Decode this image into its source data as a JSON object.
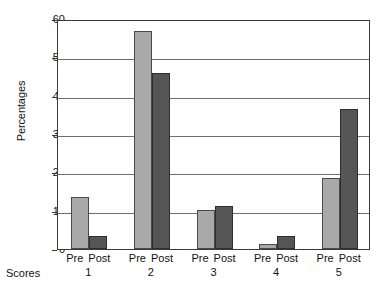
{
  "chart_data": {
    "type": "bar",
    "title": "",
    "subtitle": "",
    "xlabel": "Scores",
    "ylabel": "Percentages",
    "categories": [
      "1",
      "2",
      "3",
      "4",
      "5"
    ],
    "series": [
      {
        "name": "Pre",
        "values": [
          13.5,
          57.0,
          10.3,
          1.2,
          18.6
        ]
      },
      {
        "name": "Post",
        "values": [
          3.3,
          46.0,
          11.2,
          3.3,
          36.4
        ]
      }
    ],
    "ylim": [
      0,
      60
    ],
    "xlim": null,
    "yticks": [
      0,
      10,
      20,
      30,
      40,
      50,
      60
    ],
    "ytick_labels": [
      "0",
      "10",
      "20",
      "30",
      "40",
      "50",
      "60"
    ],
    "grid": true,
    "grid_axis": "y",
    "legend": false,
    "legend_position": "none",
    "colors": {
      "pre": "#a9a9a9",
      "post": "#555555",
      "axis": "#3a3a3a",
      "grid": "#6f6f6f",
      "text": "#111111",
      "background": "#ffffff"
    },
    "group_tick_labels": [
      {
        "pre": "Pre",
        "post": "Post",
        "number": "1"
      },
      {
        "pre": "Pre",
        "post": "Post",
        "number": "2"
      },
      {
        "pre": "Pre",
        "post": "Post",
        "number": "3"
      },
      {
        "pre": "Pre",
        "post": "Post",
        "number": "4"
      },
      {
        "pre": "Pre",
        "post": "Post",
        "number": "5"
      }
    ]
  }
}
